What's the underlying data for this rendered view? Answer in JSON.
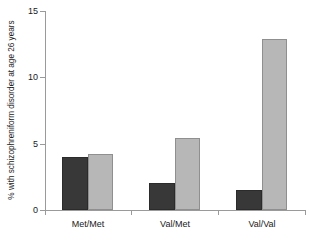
{
  "chart_data": {
    "type": "bar",
    "title": "",
    "xlabel": "",
    "ylabel": "% with schizophreniform disorder at age 26 years",
    "categories": [
      "Met/Met",
      "Val/Met",
      "Val/Val"
    ],
    "series": [
      {
        "name": "dark",
        "color": "#383838",
        "values": [
          4.0,
          2.0,
          1.5
        ]
      },
      {
        "name": "light",
        "color": "#b7b7b7",
        "values": [
          4.2,
          5.4,
          12.9
        ]
      }
    ],
    "ylim": [
      0,
      15
    ],
    "yticks": [
      0,
      5,
      10,
      15
    ],
    "ytick_labels": [
      "0",
      "5",
      "10",
      "15"
    ],
    "grid": false,
    "legend": "none"
  }
}
